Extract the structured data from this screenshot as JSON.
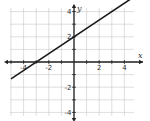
{
  "chart_data": {
    "type": "line",
    "title": "",
    "xlabel": "x",
    "ylabel": "y",
    "xlim": [
      -5,
      5
    ],
    "ylim": [
      -5,
      5
    ],
    "grid": true,
    "x_tick_labels": [
      "-2",
      "2",
      "4"
    ],
    "y_tick_labels": [
      "4",
      "2",
      "-2",
      "-4"
    ],
    "x_ticks": [
      -4,
      -2,
      2,
      4
    ],
    "y_ticks": [
      4,
      2,
      -2,
      -4
    ],
    "series": [
      {
        "name": "line",
        "equation": "y = (2/3)x + 2",
        "slope": 0.6667,
        "intercept": 2,
        "x": [
          -5,
          -3,
          0,
          4.5
        ],
        "y": [
          -1.33,
          0,
          2,
          5
        ]
      }
    ],
    "color": "#1a1a1a"
  }
}
